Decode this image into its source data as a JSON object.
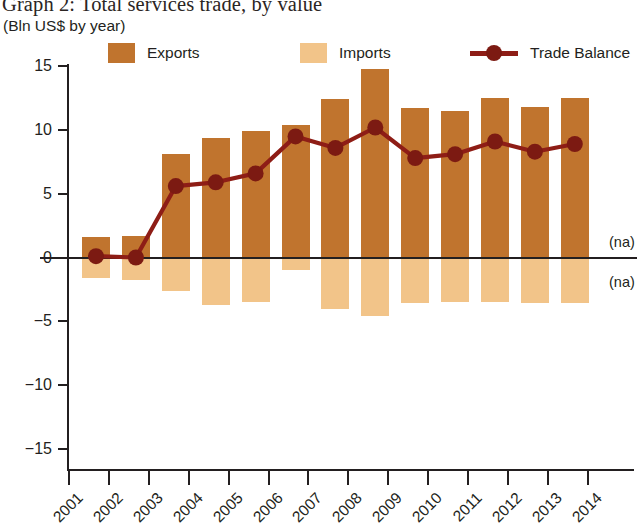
{
  "header": {
    "title": "Graph 2: Total services trade, by value",
    "subtitle": "(Bln US$ by year)"
  },
  "legend": [
    {
      "label": "Exports",
      "type": "swatch",
      "color": "#c0742e",
      "x": 108
    },
    {
      "label": "Imports",
      "type": "swatch",
      "color": "#f2c489",
      "x": 300
    },
    {
      "label": "Trade Balance",
      "type": "line",
      "color": "#8e1d16",
      "x": 470
    }
  ],
  "annotations": [
    {
      "text": "(na)",
      "x": 609,
      "y": 234
    },
    {
      "text": "(na)",
      "x": 609,
      "y": 274
    }
  ],
  "chart_data": {
    "type": "bar",
    "title": "Graph 2: Total services trade, by value",
    "subtitle": "(Bln US$ by year)",
    "xlabel": "",
    "ylabel": "Bln US$",
    "ylim": [
      -15,
      15
    ],
    "yticks": [
      15,
      10,
      5,
      0,
      -5,
      -10,
      -15
    ],
    "xticks": [
      "2001",
      "2002",
      "2003",
      "2004",
      "2005",
      "2006",
      "2007",
      "2008",
      "2009",
      "2010",
      "2011",
      "2012",
      "2013",
      "2014"
    ],
    "categories": [
      "2001",
      "2002",
      "2003",
      "2004",
      "2005",
      "2006",
      "2007",
      "2008",
      "2009",
      "2010",
      "2011",
      "2012",
      "2013"
    ],
    "grid": false,
    "legend_position": "top",
    "series": [
      {
        "name": "Exports",
        "type": "bar",
        "color": "#c0742e",
        "values": [
          1.6,
          1.7,
          8.1,
          9.4,
          9.9,
          10.4,
          12.4,
          14.8,
          11.7,
          11.5,
          12.5,
          11.8,
          12.5
        ]
      },
      {
        "name": "Imports",
        "type": "bar",
        "color": "#f2c489",
        "values": [
          -1.6,
          -1.8,
          -2.6,
          -3.7,
          -3.5,
          -1.0,
          -4.0,
          -4.6,
          -3.6,
          -3.5,
          -3.5,
          -3.6,
          -3.6
        ]
      },
      {
        "name": "Trade Balance",
        "type": "line",
        "color": "#8e1d16",
        "values": [
          0.1,
          0.0,
          5.6,
          5.9,
          6.6,
          9.5,
          8.6,
          10.2,
          7.8,
          8.1,
          9.1,
          8.3,
          8.9
        ]
      }
    ],
    "notes": [
      "(na)",
      "(na)"
    ]
  }
}
